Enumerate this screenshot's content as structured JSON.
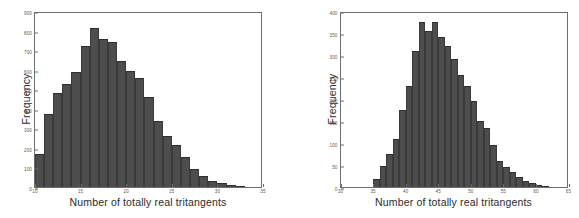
{
  "figure": {
    "background": "#ffffff",
    "bar_color": "#4d4d4d",
    "axis_color": "#6e6e6e",
    "text_color": "#2b2b2b"
  },
  "panels": [
    {
      "name": "left-histogram",
      "frame": {
        "left": 34,
        "top": 12,
        "width": 228,
        "height": 176
      },
      "xlabel_text": "Number of totally real tritangents",
      "ylabel_text": "Frequency"
    },
    {
      "name": "right-histogram",
      "frame": {
        "left": 50,
        "top": 12,
        "width": 228,
        "height": 176
      },
      "xlabel_text": "Number of totally real tritangents",
      "ylabel_text": "Frequency"
    }
  ],
  "chart_data": [
    {
      "type": "bar",
      "subtype": "histogram",
      "panel": "left",
      "title": "",
      "xlabel": "Number of totally real tritangents",
      "ylabel": "Frequency",
      "xlim": [
        10,
        35
      ],
      "ylim": [
        0,
        900
      ],
      "xticks": [
        10,
        15,
        20,
        25,
        30,
        35
      ],
      "xtick_labels": [
        "10",
        "15",
        "20",
        "25",
        "30",
        "35"
      ],
      "yticks": [
        0,
        100,
        200,
        300,
        400,
        500,
        600,
        700,
        800,
        900
      ],
      "ytick_labels": [
        "0",
        "100",
        "200",
        "300",
        "400",
        "500",
        "600",
        "700",
        "800",
        "900"
      ],
      "grid": false,
      "legend": null,
      "bin_width": 1,
      "bin_starts": [
        10,
        11,
        12,
        13,
        14,
        15,
        16,
        17,
        18,
        19,
        20,
        21,
        22,
        23,
        24,
        25,
        26,
        27,
        28,
        29,
        30,
        31,
        32
      ],
      "categories": [
        "10",
        "11",
        "12",
        "13",
        "14",
        "15",
        "16",
        "17",
        "18",
        "19",
        "20",
        "21",
        "22",
        "23",
        "24",
        "25",
        "26",
        "27",
        "28",
        "29",
        "30",
        "31",
        "32"
      ],
      "values": [
        170,
        375,
        480,
        525,
        590,
        720,
        815,
        755,
        740,
        645,
        595,
        555,
        460,
        340,
        260,
        215,
        155,
        90,
        55,
        30,
        18,
        10,
        5
      ]
    },
    {
      "type": "bar",
      "subtype": "histogram",
      "panel": "right",
      "title": "",
      "xlabel": "Number of totally real tritangents",
      "ylabel": "Frequency",
      "xlim": [
        30,
        65
      ],
      "ylim": [
        0,
        400
      ],
      "xticks": [
        30,
        35,
        40,
        45,
        50,
        55,
        60,
        65
      ],
      "xtick_labels": [
        "30",
        "35",
        "40",
        "45",
        "50",
        "55",
        "60",
        "65"
      ],
      "yticks": [
        0,
        50,
        100,
        150,
        200,
        250,
        300,
        350,
        400
      ],
      "ytick_labels": [
        "0",
        "50",
        "100",
        "150",
        "200",
        "250",
        "300",
        "350",
        "400"
      ],
      "grid": false,
      "legend": null,
      "bin_width": 1,
      "bin_starts": [
        35,
        36,
        37,
        38,
        39,
        40,
        41,
        42,
        43,
        44,
        45,
        46,
        47,
        48,
        49,
        50,
        51,
        52,
        53,
        54,
        55,
        56,
        57,
        58,
        59,
        60,
        61
      ],
      "categories": [
        "35",
        "36",
        "37",
        "38",
        "39",
        "40",
        "41",
        "42",
        "43",
        "44",
        "45",
        "46",
        "47",
        "48",
        "49",
        "50",
        "51",
        "52",
        "53",
        "54",
        "55",
        "56",
        "57",
        "58",
        "59",
        "60",
        "61"
      ],
      "values": [
        18,
        48,
        75,
        110,
        175,
        230,
        310,
        375,
        355,
        375,
        340,
        320,
        290,
        255,
        230,
        195,
        150,
        135,
        95,
        60,
        45,
        33,
        22,
        14,
        8,
        5,
        3
      ]
    }
  ]
}
